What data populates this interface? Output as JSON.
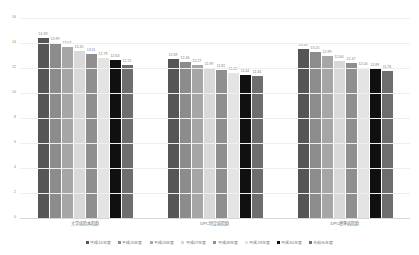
{
  "chart_data": {
    "type": "bar",
    "title": "",
    "xlabel": "",
    "ylabel": "",
    "ylim": [
      0,
      16
    ],
    "yticks": [
      16,
      14,
      12,
      10,
      8,
      6,
      4,
      2,
      0
    ],
    "grid": true,
    "legend_position": "bottom",
    "categories": [
      "大学病院本院群",
      "DPC特定病院群",
      "DPC標準病院群"
    ],
    "series": [
      {
        "name": "平成24年度",
        "color": "#565656",
        "values": [
          14.39,
          12.69,
          13.5
        ]
      },
      {
        "name": "平成25年度",
        "color": "#8c8c8c",
        "values": [
          13.99,
          12.46,
          13.25
        ]
      },
      {
        "name": "平成26年度",
        "color": "#a6a6a6",
        "values": [
          13.67,
          12.27,
          12.99
        ]
      },
      {
        "name": "平成27年度",
        "color": "#d9d9d9",
        "values": [
          13.35,
          11.99,
          12.6
        ]
      },
      {
        "name": "平成28年度",
        "color": "#8f8f8f",
        "values": [
          13.11,
          11.81,
          12.37
        ]
      },
      {
        "name": "平成29年度",
        "color": "#e4e4e4",
        "values": [
          12.79,
          11.62,
          12.04
        ]
      },
      {
        "name": "平成30年度",
        "color": "#101010",
        "values": [
          12.63,
          11.44,
          11.89
        ]
      },
      {
        "name": "令和元年度",
        "color": "#6e6e6e",
        "values": [
          12.21,
          11.34,
          11.76
        ]
      }
    ]
  }
}
